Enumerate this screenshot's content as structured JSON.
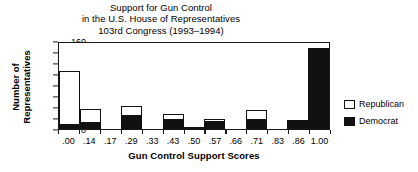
{
  "chart_data": {
    "type": "bar",
    "title": "Support for Gun Control in the U.S. House of Representatives 103rd Congress (1993–1994)",
    "title_lines": [
      "Support for Gun Control",
      "in the U.S. House of Representatives",
      "103rd Congress (1993–1994)"
    ],
    "xlabel": "Gun Control Support Scores",
    "ylabel": "Number of Representatives",
    "ylabel_lines": [
      "Number of",
      "Representatives"
    ],
    "categories": [
      ".00",
      ".14",
      ".17",
      ".29",
      ".33",
      ".43",
      ".50",
      ".57",
      ".66",
      ".71",
      ".83",
      ".86",
      "1.00"
    ],
    "ylim": [
      0,
      160
    ],
    "yticks": [
      0,
      20,
      40,
      60,
      80,
      100,
      120,
      140,
      160
    ],
    "grid": false,
    "stacked": true,
    "legend_position": "right",
    "series": [
      {
        "name": "Democrat",
        "color": "#111111",
        "values": [
          10,
          13,
          0,
          26,
          0,
          18,
          3,
          14,
          0,
          19,
          0,
          14,
          148
        ]
      },
      {
        "name": "Republican",
        "color": "#ffffff",
        "values": [
          95,
          24,
          0,
          16,
          0,
          9,
          1,
          4,
          0,
          16,
          0,
          2,
          0
        ]
      }
    ],
    "totals": [
      105,
      37,
      0,
      42,
      0,
      27,
      4,
      18,
      0,
      35,
      0,
      16,
      148
    ]
  },
  "legend": {
    "items": [
      {
        "label": "Republican",
        "swatch": "hollow-square"
      },
      {
        "label": "Democrat",
        "swatch": "filled-square"
      }
    ]
  }
}
